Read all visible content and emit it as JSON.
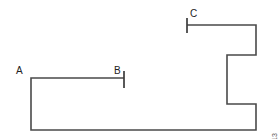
{
  "figure": {
    "background_color": "#ffffff",
    "stroke_color": "#4a4a4a",
    "tick_color": "#3c3c3c",
    "width": 280,
    "height": 139,
    "labels": {
      "a": "A",
      "b": "B",
      "c": "C"
    },
    "copyright": "© Cengage Learning 2013"
  },
  "chart_data": {
    "type": "line",
    "title": "",
    "xlabel": "",
    "ylabel": "",
    "xlim": [
      0,
      280
    ],
    "ylim": [
      139,
      0
    ],
    "grid": false,
    "legend": null,
    "annotations": [
      {
        "label": "A",
        "x": 31,
        "y": 78,
        "text_x": 17,
        "text_y": 73
      },
      {
        "label": "B",
        "x": 124,
        "y": 78,
        "text_x": 115,
        "text_y": 73
      },
      {
        "label": "C",
        "x": 187,
        "y": 25,
        "text_x": 190,
        "text_y": 17
      }
    ],
    "series": [
      {
        "name": "path",
        "points": [
          [
            124,
            78
          ],
          [
            31,
            78
          ],
          [
            31,
            130
          ],
          [
            256,
            130
          ],
          [
            256,
            104
          ],
          [
            227,
            104
          ],
          [
            227,
            55
          ],
          [
            256,
            55
          ],
          [
            256,
            25
          ],
          [
            187,
            25
          ]
        ]
      }
    ],
    "ticks": [
      {
        "name": "B",
        "x": 124,
        "y1": 71,
        "y2": 88
      },
      {
        "name": "C",
        "x": 187,
        "y1": 18,
        "y2": 33
      }
    ]
  }
}
